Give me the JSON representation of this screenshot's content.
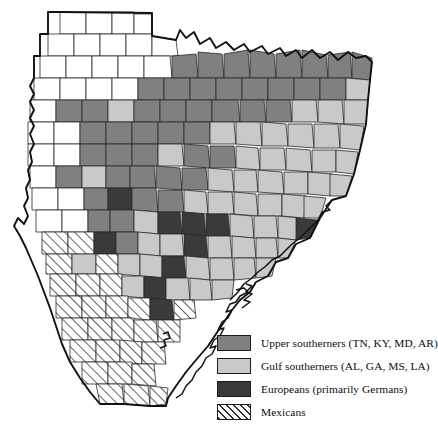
{
  "figure": {
    "name": "texas-ethnic-settlement-map",
    "region": "Texas",
    "background_color": "#ffffff"
  },
  "palette": {
    "upper_southerners": "#808080",
    "gulf_southerners": "#c9c9c9",
    "europeans": "#3a3a3a",
    "mexicans_hatch_bg": "#ffffff",
    "mexicans_hatch_line": "#2e2e2e",
    "unclassified": "#ffffff",
    "county_border": "#2a2a2a",
    "state_border": "#111111"
  },
  "legend": {
    "name": "map-legend",
    "items": [
      {
        "swatch": "upper_southerners",
        "label": "Upper southerners (TN, KY, MD, AR)",
        "color": "#808080",
        "pattern": "solid"
      },
      {
        "swatch": "gulf_southerners",
        "label": "Gulf southerners (AL, GA, MS, LA)",
        "color": "#c9c9c9",
        "pattern": "solid"
      },
      {
        "swatch": "europeans",
        "label": "Europeans (primarily Germans)",
        "color": "#3a3a3a",
        "pattern": "solid"
      },
      {
        "swatch": "mexicans",
        "label": "Mexicans",
        "color": "#ffffff",
        "pattern": "diagonal-hatch"
      }
    ]
  },
  "map_data": {
    "type": "choropleth",
    "categories": [
      "upper_southerners",
      "gulf_southerners",
      "europeans",
      "mexicans",
      "unclassified"
    ],
    "counties": [
      {
        "p": "M60,12 L86,12 L86,34 L60,34 Z",
        "c": "unclassified"
      },
      {
        "p": "M86,12 L112,12 L112,34 L86,34 Z",
        "c": "unclassified"
      },
      {
        "p": "M112,12 L134,12 L134,34 L112,34 Z",
        "c": "unclassified"
      },
      {
        "p": "M134,14 L152,14 L152,34 L134,34 Z",
        "c": "unclassified"
      },
      {
        "p": "M48,34 L74,34 L74,56 L48,56 Z",
        "c": "unclassified"
      },
      {
        "p": "M74,34 L100,34 L100,56 L74,56 Z",
        "c": "unclassified"
      },
      {
        "p": "M100,34 L126,34 L126,56 L100,56 Z",
        "c": "unclassified"
      },
      {
        "p": "M126,34 L152,34 L152,56 L126,56 Z",
        "c": "unclassified"
      },
      {
        "p": "M152,36 L176,40 L178,56 L152,56 Z",
        "c": "unclassified"
      },
      {
        "p": "M40,56 L66,56 L66,78 L40,78 Z",
        "c": "unclassified"
      },
      {
        "p": "M66,56 L92,56 L92,78 L66,78 Z",
        "c": "unclassified"
      },
      {
        "p": "M92,56 L118,56 L118,78 L92,78 Z",
        "c": "unclassified"
      },
      {
        "p": "M118,56 L144,56 L144,78 L118,78 Z",
        "c": "unclassified"
      },
      {
        "p": "M144,56 L170,56 L172,78 L144,78 Z",
        "c": "unclassified"
      },
      {
        "p": "M172,56 L196,54 L198,78 L172,78 Z",
        "c": "upper_southerners"
      },
      {
        "p": "M198,52 L222,54 L224,78 L198,78 Z",
        "c": "upper_southerners"
      },
      {
        "p": "M224,54 L248,50 L250,78 L224,78 Z",
        "c": "upper_southerners"
      },
      {
        "p": "M250,50 L274,54 L276,78 L250,78 Z",
        "c": "upper_southerners"
      },
      {
        "p": "M276,54 L300,50 L302,78 L276,78 Z",
        "c": "upper_southerners"
      },
      {
        "p": "M302,50 L326,55 L328,78 L302,78 Z",
        "c": "upper_southerners"
      },
      {
        "p": "M328,55 L350,52 L352,78 L328,78 Z",
        "c": "upper_southerners"
      },
      {
        "p": "M352,52 L372,58 L370,80 L352,78 Z",
        "c": "upper_southerners"
      },
      {
        "p": "M34,78 L60,78 L60,100 L34,100 Z",
        "c": "unclassified"
      },
      {
        "p": "M60,78 L86,78 L86,100 L60,100 Z",
        "c": "unclassified"
      },
      {
        "p": "M86,78 L112,78 L112,100 L86,100 Z",
        "c": "unclassified"
      },
      {
        "p": "M112,78 L138,78 L138,100 L112,100 Z",
        "c": "unclassified"
      },
      {
        "p": "M138,78 L164,78 L164,100 L138,100 Z",
        "c": "upper_southerners"
      },
      {
        "p": "M164,78 L190,78 L190,100 L164,100 Z",
        "c": "upper_southerners"
      },
      {
        "p": "M190,78 L216,78 L216,100 L190,100 Z",
        "c": "upper_southerners"
      },
      {
        "p": "M216,78 L242,78 L242,100 L216,100 Z",
        "c": "upper_southerners"
      },
      {
        "p": "M242,78 L268,78 L268,100 L242,100 Z",
        "c": "upper_southerners"
      },
      {
        "p": "M268,78 L294,78 L294,100 L268,100 Z",
        "c": "upper_southerners"
      },
      {
        "p": "M294,78 L320,78 L320,100 L294,100 Z",
        "c": "upper_southerners"
      },
      {
        "p": "M320,78 L346,78 L346,100 L320,100 Z",
        "c": "upper_southerners"
      },
      {
        "p": "M346,78 L370,80 L368,100 L346,100 Z",
        "c": "gulf_southerners"
      },
      {
        "p": "M30,100 L56,100 L56,122 L30,122 Z",
        "c": "unclassified"
      },
      {
        "p": "M56,100 L82,100 L82,122 L56,122 Z",
        "c": "upper_southerners"
      },
      {
        "p": "M82,100 L108,100 L108,122 L82,122 Z",
        "c": "upper_southerners"
      },
      {
        "p": "M108,100 L134,100 L134,122 L108,122 Z",
        "c": "gulf_southerners"
      },
      {
        "p": "M134,100 L160,100 L160,122 L134,122 Z",
        "c": "upper_southerners"
      },
      {
        "p": "M160,100 L186,100 L186,122 L160,122 Z",
        "c": "upper_southerners"
      },
      {
        "p": "M186,100 L212,100 L212,122 L186,122 Z",
        "c": "upper_southerners"
      },
      {
        "p": "M212,100 L238,100 L240,122 L212,122 Z",
        "c": "upper_southerners"
      },
      {
        "p": "M240,100 L264,100 L266,122 L240,122 Z",
        "c": "upper_southerners"
      },
      {
        "p": "M266,100 L290,100 L292,122 L266,122 Z",
        "c": "upper_southerners"
      },
      {
        "p": "M292,100 L316,100 L318,122 L292,122 Z",
        "c": "gulf_southerners"
      },
      {
        "p": "M318,100 L342,100 L344,124 L318,122 Z",
        "c": "gulf_southerners"
      },
      {
        "p": "M344,100 L368,100 L366,124 L344,124 Z",
        "c": "gulf_southerners"
      },
      {
        "p": "M28,122 L54,122 L54,144 L28,144 Z",
        "c": "unclassified"
      },
      {
        "p": "M54,122 L80,122 L80,144 L54,144 Z",
        "c": "unclassified"
      },
      {
        "p": "M80,122 L106,122 L106,144 L80,144 Z",
        "c": "upper_southerners"
      },
      {
        "p": "M106,122 L132,122 L132,144 L106,144 Z",
        "c": "upper_southerners"
      },
      {
        "p": "M132,122 L158,122 L158,144 L132,144 Z",
        "c": "upper_southerners"
      },
      {
        "p": "M158,122 L184,122 L184,144 L158,144 Z",
        "c": "upper_southerners"
      },
      {
        "p": "M184,122 L210,122 L210,144 L184,144 Z",
        "c": "upper_southerners"
      },
      {
        "p": "M210,122 L234,122 L236,144 L210,144 Z",
        "c": "gulf_southerners"
      },
      {
        "p": "M236,122 L260,122 L262,146 L236,144 Z",
        "c": "gulf_southerners"
      },
      {
        "p": "M262,122 L286,124 L288,146 L262,146 Z",
        "c": "gulf_southerners"
      },
      {
        "p": "M288,124 L312,124 L314,148 L288,146 Z",
        "c": "gulf_southerners"
      },
      {
        "p": "M314,124 L338,124 L340,148 L314,148 Z",
        "c": "gulf_southerners"
      },
      {
        "p": "M340,124 L364,126 L360,150 L340,148 Z",
        "c": "gulf_southerners"
      },
      {
        "p": "M28,144 L54,144 L54,166 L28,166 Z",
        "c": "unclassified"
      },
      {
        "p": "M54,144 L80,144 L80,166 L54,166 Z",
        "c": "unclassified"
      },
      {
        "p": "M80,144 L106,144 L106,166 L80,166 Z",
        "c": "upper_southerners"
      },
      {
        "p": "M106,144 L132,144 L132,166 L106,166 Z",
        "c": "upper_southerners"
      },
      {
        "p": "M132,144 L158,144 L158,166 L132,166 Z",
        "c": "upper_southerners"
      },
      {
        "p": "M158,144 L182,144 L184,166 L158,166 Z",
        "c": "gulf_southerners"
      },
      {
        "p": "M184,144 L208,146 L210,168 L184,166 Z",
        "c": "upper_southerners"
      },
      {
        "p": "M210,146 L234,146 L236,168 L210,168 Z",
        "c": "upper_southerners"
      },
      {
        "p": "M236,146 L258,148 L260,170 L236,168 Z",
        "c": "gulf_southerners"
      },
      {
        "p": "M260,148 L284,148 L286,170 L260,170 Z",
        "c": "gulf_southerners"
      },
      {
        "p": "M286,148 L310,150 L312,172 L286,170 Z",
        "c": "gulf_southerners"
      },
      {
        "p": "M312,150 L336,150 L336,172 L312,172 Z",
        "c": "gulf_southerners"
      },
      {
        "p": "M336,150 L358,152 L354,174 L336,172 Z",
        "c": "gulf_southerners"
      },
      {
        "p": "M30,166 L56,166 L56,188 L30,188 Z",
        "c": "unclassified"
      },
      {
        "p": "M56,166 L82,166 L82,188 L56,188 Z",
        "c": "upper_southerners"
      },
      {
        "p": "M82,166 L106,166 L106,188 L82,188 Z",
        "c": "gulf_southerners"
      },
      {
        "p": "M106,166 L130,166 L130,188 L106,188 Z",
        "c": "upper_southerners"
      },
      {
        "p": "M130,166 L154,166 L156,188 L130,188 Z",
        "c": "upper_southerners"
      },
      {
        "p": "M156,166 L180,168 L182,190 L156,188 Z",
        "c": "upper_southerners"
      },
      {
        "p": "M182,168 L206,168 L208,190 L182,190 Z",
        "c": "upper_southerners"
      },
      {
        "p": "M208,168 L232,170 L234,192 L208,190 Z",
        "c": "gulf_southerners"
      },
      {
        "p": "M234,170 L256,170 L258,192 L234,192 Z",
        "c": "gulf_southerners"
      },
      {
        "p": "M258,170 L282,172 L284,194 L258,192 Z",
        "c": "gulf_southerners"
      },
      {
        "p": "M284,172 L308,172 L308,194 L284,194 Z",
        "c": "gulf_southerners"
      },
      {
        "p": "M308,172 L332,174 L330,196 L308,194 Z",
        "c": "gulf_southerners"
      },
      {
        "p": "M330,174 L352,176 L346,196 L330,196 Z",
        "c": "gulf_southerners"
      },
      {
        "p": "M32,188 L58,188 L58,210 L32,210 Z",
        "c": "unclassified"
      },
      {
        "p": "M58,188 L84,188 L84,210 L58,210 Z",
        "c": "unclassified"
      },
      {
        "p": "M84,188 L108,188 L108,210 L84,210 Z",
        "c": "upper_southerners"
      },
      {
        "p": "M108,188 L132,188 L132,210 L108,210 Z",
        "c": "europeans"
      },
      {
        "p": "M132,188 L156,188 L158,212 L132,210 Z",
        "c": "upper_southerners"
      },
      {
        "p": "M158,190 L182,190 L184,212 L158,212 Z",
        "c": "upper_southerners"
      },
      {
        "p": "M184,190 L206,192 L208,214 L184,212 Z",
        "c": "gulf_southerners"
      },
      {
        "p": "M208,192 L232,192 L234,214 L208,214 Z",
        "c": "gulf_southerners"
      },
      {
        "p": "M234,192 L256,194 L258,216 L234,214 Z",
        "c": "gulf_southerners"
      },
      {
        "p": "M258,194 L282,194 L282,216 L258,216 Z",
        "c": "gulf_southerners"
      },
      {
        "p": "M282,194 L306,196 L304,218 L282,216 Z",
        "c": "gulf_southerners"
      },
      {
        "p": "M304,196 L326,198 L320,218 L304,218 Z",
        "c": "gulf_southerners"
      },
      {
        "p": "M36,210 L62,210 L62,232 L36,232 Z",
        "c": "unclassified"
      },
      {
        "p": "M62,210 L88,210 L88,232 L62,232 Z",
        "c": "unclassified"
      },
      {
        "p": "M88,210 L110,210 L110,232 L88,232 Z",
        "c": "upper_southerners"
      },
      {
        "p": "M110,210 L134,210 L134,232 L110,232 Z",
        "c": "upper_southerners"
      },
      {
        "p": "M134,210 L158,212 L158,234 L134,232 Z",
        "c": "gulf_southerners"
      },
      {
        "p": "M158,212 L180,212 L182,234 L158,234 Z",
        "c": "europeans"
      },
      {
        "p": "M182,212 L204,214 L206,236 L182,234 Z",
        "c": "europeans"
      },
      {
        "p": "M206,214 L228,214 L230,236 L206,236 Z",
        "c": "europeans"
      },
      {
        "p": "M230,214 L252,216 L254,238 L230,236 Z",
        "c": "gulf_southerners"
      },
      {
        "p": "M254,216 L276,216 L278,238 L254,238 Z",
        "c": "gulf_southerners"
      },
      {
        "p": "M278,216 L300,218 L296,240 L278,238 Z",
        "c": "gulf_southerners"
      },
      {
        "p": "M296,218 L318,220 L310,238 L296,240 Z",
        "c": "europeans"
      },
      {
        "p": "M42,232 L68,232 L68,254 L42,254 Z",
        "c": "mexicans"
      },
      {
        "p": "M68,232 L94,232 L94,254 L68,254 Z",
        "c": "mexicans"
      },
      {
        "p": "M94,232 L116,232 L116,254 L94,254 Z",
        "c": "europeans"
      },
      {
        "p": "M116,232 L138,232 L138,254 L116,254 Z",
        "c": "upper_southerners"
      },
      {
        "p": "M138,232 L160,234 L160,256 L138,254 Z",
        "c": "gulf_southerners"
      },
      {
        "p": "M160,234 L182,234 L184,256 L160,256 Z",
        "c": "gulf_southerners"
      },
      {
        "p": "M184,234 L206,236 L208,258 L184,256 Z",
        "c": "europeans"
      },
      {
        "p": "M208,236 L230,236 L232,258 L208,258 Z",
        "c": "gulf_southerners"
      },
      {
        "p": "M232,236 L254,238 L256,258 L232,258 Z",
        "c": "gulf_southerners"
      },
      {
        "p": "M256,238 L276,238 L278,258 L256,258 Z",
        "c": "gulf_southerners"
      },
      {
        "p": "M278,238 L296,240 L288,258 L278,258 Z",
        "c": "gulf_southerners"
      },
      {
        "p": "M46,254 L72,254 L72,274 L46,274 Z",
        "c": "mexicans"
      },
      {
        "p": "M72,254 L96,254 L96,274 L72,274 Z",
        "c": "gulf_southerners"
      },
      {
        "p": "M96,254 L118,254 L118,274 L96,274 Z",
        "c": "mexicans"
      },
      {
        "p": "M118,254 L140,254 L140,276 L118,274 Z",
        "c": "gulf_southerners"
      },
      {
        "p": "M140,254 L162,256 L162,278 L140,276 Z",
        "c": "gulf_southerners"
      },
      {
        "p": "M162,256 L184,256 L186,278 L162,278 Z",
        "c": "europeans"
      },
      {
        "p": "M186,256 L208,258 L210,280 L186,278 Z",
        "c": "gulf_southerners"
      },
      {
        "p": "M210,258 L232,258 L234,280 L210,280 Z",
        "c": "gulf_southerners"
      },
      {
        "p": "M234,258 L254,258 L256,278 L234,280 Z",
        "c": "gulf_southerners"
      },
      {
        "p": "M256,258 L276,258 L272,276 L256,278 Z",
        "c": "gulf_southerners"
      },
      {
        "p": "M50,274 L76,274 L76,296 L50,296 Z",
        "c": "mexicans"
      },
      {
        "p": "M76,274 L100,274 L100,296 L76,296 Z",
        "c": "mexicans"
      },
      {
        "p": "M100,274 L122,274 L122,296 L100,296 Z",
        "c": "mexicans"
      },
      {
        "p": "M122,276 L144,276 L144,298 L122,296 Z",
        "c": "gulf_southerners"
      },
      {
        "p": "M144,276 L166,278 L166,300 L144,298 Z",
        "c": "europeans"
      },
      {
        "p": "M166,278 L188,278 L190,300 L166,300 Z",
        "c": "gulf_southerners"
      },
      {
        "p": "M190,278 L210,280 L212,300 L190,300 Z",
        "c": "gulf_southerners"
      },
      {
        "p": "M212,280 L234,280 L232,298 L212,300 Z",
        "c": "gulf_southerners"
      },
      {
        "p": "M56,296 L82,296 L82,318 L56,318 Z",
        "c": "mexicans"
      },
      {
        "p": "M82,296 L106,296 L106,318 L82,318 Z",
        "c": "mexicans"
      },
      {
        "p": "M106,296 L128,296 L128,318 L106,318 Z",
        "c": "mexicans"
      },
      {
        "p": "M128,298 L150,298 L150,320 L128,318 Z",
        "c": "mexicans"
      },
      {
        "p": "M150,298 L172,300 L174,320 L150,320 Z",
        "c": "europeans"
      },
      {
        "p": "M174,300 L194,300 L196,318 L174,320 Z",
        "c": "mexicans"
      },
      {
        "p": "M62,318 L88,318 L88,340 L62,340 Z",
        "c": "mexicans"
      },
      {
        "p": "M88,318 L112,318 L112,340 L88,340 Z",
        "c": "mexicans"
      },
      {
        "p": "M112,318 L134,318 L134,342 L112,340 Z",
        "c": "mexicans"
      },
      {
        "p": "M134,320 L156,320 L158,342 L134,342 Z",
        "c": "mexicans"
      },
      {
        "p": "M158,320 L180,320 L180,342 L158,342 Z",
        "c": "mexicans"
      },
      {
        "p": "M70,340 L96,340 L96,362 L70,362 Z",
        "c": "mexicans"
      },
      {
        "p": "M96,340 L120,340 L120,362 L96,362 Z",
        "c": "mexicans"
      },
      {
        "p": "M120,340 L142,342 L142,364 L120,362 Z",
        "c": "mexicans"
      },
      {
        "p": "M142,342 L164,342 L166,364 L142,364 Z",
        "c": "mexicans"
      },
      {
        "p": "M82,362 L108,362 L108,384 L82,384 Z",
        "c": "mexicans"
      },
      {
        "p": "M108,362 L132,362 L132,384 L108,384 Z",
        "c": "mexicans"
      },
      {
        "p": "M132,364 L154,364 L156,386 L132,384 Z",
        "c": "mexicans"
      },
      {
        "p": "M96,384 L122,384 L124,404 L100,404 Z",
        "c": "mexicans"
      },
      {
        "p": "M124,384 L148,386 L150,406 L124,404 Z",
        "c": "mexicans"
      },
      {
        "p": "M150,386 L168,388 L166,404 L150,406 Z",
        "c": "mexicans"
      }
    ],
    "state_outline": "M60,12 L152,13 L152,36 L176,40 L180,30 L186,38 L194,32 L200,44 L210,38 L216,48 L226,42 L234,50 L244,44 L250,52 L262,46 L268,54 L280,48 L286,56 L296,50 L302,58 L312,50 L320,58 L330,52 L338,60 L348,52 L356,58 L366,56 L372,62 L370,80 L368,100 L366,124 L360,150 L354,174 L346,196 L332,200 L320,218 L310,238 L296,244 L288,258 L276,262 L268,276 L256,282 L250,292 L240,300 L232,310 L224,322 L216,334 L208,346 L196,360 L186,372 L176,386 L168,398 L166,406 L150,406 L124,404 L100,404 L90,392 L80,378 L70,362 L62,344 L56,326 L50,308 L44,292 L38,276 L32,262 L26,248 L20,236 L14,226 L18,218 L24,224 L28,216 L24,206 L28,198 L26,188 L30,180 L28,170 L32,162 L30,152 L34,144 L30,134 L34,126 L30,118 L34,110 L30,102 L34,94 L30,86 L34,78 L34,56 L40,56 L40,34 L48,34 L48,12 Z"
  }
}
